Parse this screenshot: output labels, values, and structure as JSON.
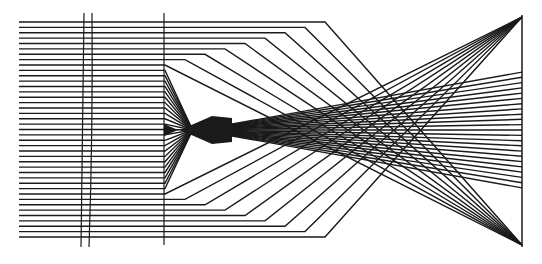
{
  "diagram": {
    "type": "ray-trace",
    "ray_color": "#1a1a1a",
    "background": "#ffffff",
    "ray_count": 41,
    "ray_y_top": 22,
    "ray_y_bottom": 237,
    "ray_x_start": 19,
    "lens": {
      "x_left_top": 84,
      "x_right_top": 92,
      "x_left_bottom": 81,
      "x_right_bottom": 89,
      "y_top": 13,
      "y_bottom": 247
    },
    "plane": {
      "x": 164,
      "y_top": 13,
      "y_bottom": 245
    },
    "focus": {
      "x": 192,
      "y": 130
    },
    "pre_focus_x": 170,
    "screen": {
      "x": 522,
      "y_top": 15,
      "y_bottom": 247
    }
  }
}
